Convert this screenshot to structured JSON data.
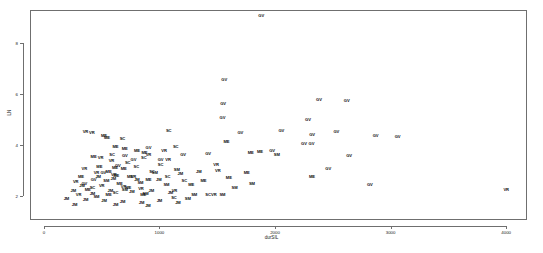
{
  "chart_data": {
    "type": "scatter",
    "title": "",
    "xlabel": "durSIL",
    "ylabel": "LN",
    "xlim": [
      -120,
      4180
    ],
    "ylim": [
      1.05,
      9.3
    ],
    "grid": false,
    "legend": null,
    "marker_style": "text-labels",
    "xticks": [
      0,
      1000,
      2000,
      3000,
      4000
    ],
    "xtick_labels": [
      "0",
      "1000",
      "2000",
      "3000",
      "4000"
    ],
    "yticks": [
      2,
      4,
      6,
      8
    ],
    "ytick_labels": [
      "2",
      "4",
      "6",
      "8"
    ],
    "point_groups": [
      "GV",
      "VR",
      "ME",
      "SC",
      "SM",
      "JM"
    ],
    "points": [
      {
        "label": "GV",
        "x": 1880,
        "y": 9.05
      },
      {
        "label": "GV",
        "x": 1560,
        "y": 6.55
      },
      {
        "label": "GV",
        "x": 1550,
        "y": 5.62
      },
      {
        "label": "GV",
        "x": 2380,
        "y": 5.75
      },
      {
        "label": "GV",
        "x": 2620,
        "y": 5.72
      },
      {
        "label": "GV",
        "x": 1545,
        "y": 5.05
      },
      {
        "label": "GV",
        "x": 2285,
        "y": 4.98
      },
      {
        "label": "GV",
        "x": 2530,
        "y": 4.5
      },
      {
        "label": "GV",
        "x": 2320,
        "y": 4.38
      },
      {
        "label": "GV",
        "x": 2870,
        "y": 4.35
      },
      {
        "label": "GV",
        "x": 3060,
        "y": 4.32
      },
      {
        "label": "GV",
        "x": 2250,
        "y": 4.05
      },
      {
        "label": "GV",
        "x": 2315,
        "y": 4.02
      },
      {
        "label": "GV",
        "x": 1700,
        "y": 4.48
      },
      {
        "label": "GV",
        "x": 2055,
        "y": 4.56
      },
      {
        "label": "GV",
        "x": 1975,
        "y": 3.78
      },
      {
        "label": "GV",
        "x": 2640,
        "y": 3.55
      },
      {
        "label": "GV",
        "x": 2460,
        "y": 3.05
      },
      {
        "label": "GV",
        "x": 2820,
        "y": 2.42
      },
      {
        "label": "GV",
        "x": 1205,
        "y": 3.62
      },
      {
        "label": "GV",
        "x": 1420,
        "y": 3.65
      },
      {
        "label": "GV",
        "x": 905,
        "y": 3.88
      },
      {
        "label": "GV",
        "x": 1010,
        "y": 3.42
      },
      {
        "label": "GV",
        "x": 700,
        "y": 3.55
      },
      {
        "label": "GV",
        "x": 775,
        "y": 3.4
      },
      {
        "label": "GV",
        "x": 640,
        "y": 3.18
      },
      {
        "label": "GV",
        "x": 515,
        "y": 2.88
      },
      {
        "label": "GV",
        "x": 430,
        "y": 2.62
      },
      {
        "label": "GV",
        "x": 350,
        "y": 2.45
      },
      {
        "label": "ME",
        "x": 1580,
        "y": 4.12
      },
      {
        "label": "ME",
        "x": 2320,
        "y": 2.72
      },
      {
        "label": "ME",
        "x": 1790,
        "y": 3.68
      },
      {
        "label": "ME",
        "x": 1870,
        "y": 3.72
      },
      {
        "label": "ME",
        "x": 1755,
        "y": 2.88
      },
      {
        "label": "ME",
        "x": 1600,
        "y": 2.7
      },
      {
        "label": "ME",
        "x": 1380,
        "y": 2.58
      },
      {
        "label": "ME",
        "x": 1275,
        "y": 2.42
      },
      {
        "label": "ME",
        "x": 520,
        "y": 4.35
      },
      {
        "label": "ME",
        "x": 545,
        "y": 4.28
      },
      {
        "label": "ME",
        "x": 620,
        "y": 3.92
      },
      {
        "label": "ME",
        "x": 700,
        "y": 3.82
      },
      {
        "label": "ME",
        "x": 805,
        "y": 3.78
      },
      {
        "label": "ME",
        "x": 870,
        "y": 3.7
      },
      {
        "label": "ME",
        "x": 430,
        "y": 3.52
      },
      {
        "label": "ME",
        "x": 480,
        "y": 3.12
      },
      {
        "label": "ME",
        "x": 615,
        "y": 3.08
      },
      {
        "label": "ME",
        "x": 690,
        "y": 3.05
      },
      {
        "label": "ME",
        "x": 560,
        "y": 2.92
      },
      {
        "label": "ME",
        "x": 625,
        "y": 2.78
      },
      {
        "label": "ME",
        "x": 745,
        "y": 2.72
      },
      {
        "label": "ME",
        "x": 320,
        "y": 2.72
      },
      {
        "label": "ME",
        "x": 905,
        "y": 2.62
      },
      {
        "label": "ME",
        "x": 655,
        "y": 2.48
      },
      {
        "label": "ME",
        "x": 730,
        "y": 2.3
      },
      {
        "label": "ME",
        "x": 380,
        "y": 2.22
      },
      {
        "label": "ME",
        "x": 560,
        "y": 2.05
      },
      {
        "label": "ME",
        "x": 860,
        "y": 2.02
      },
      {
        "label": "VR",
        "x": 4000,
        "y": 2.22
      },
      {
        "label": "VR",
        "x": 1490,
        "y": 3.22
      },
      {
        "label": "VR",
        "x": 1505,
        "y": 2.98
      },
      {
        "label": "VR",
        "x": 1075,
        "y": 3.4
      },
      {
        "label": "VR",
        "x": 360,
        "y": 4.52
      },
      {
        "label": "VR",
        "x": 415,
        "y": 4.48
      },
      {
        "label": "VR",
        "x": 1040,
        "y": 3.78
      },
      {
        "label": "VR",
        "x": 905,
        "y": 3.62
      },
      {
        "label": "VR",
        "x": 490,
        "y": 3.48
      },
      {
        "label": "VR",
        "x": 585,
        "y": 3.35
      },
      {
        "label": "VR",
        "x": 350,
        "y": 3.05
      },
      {
        "label": "VR",
        "x": 455,
        "y": 2.88
      },
      {
        "label": "VR",
        "x": 605,
        "y": 2.82
      },
      {
        "label": "VR",
        "x": 775,
        "y": 2.75
      },
      {
        "label": "VR",
        "x": 275,
        "y": 2.55
      },
      {
        "label": "VR",
        "x": 500,
        "y": 2.38
      },
      {
        "label": "VR",
        "x": 690,
        "y": 2.35
      },
      {
        "label": "VR",
        "x": 840,
        "y": 2.28
      },
      {
        "label": "VR",
        "x": 1130,
        "y": 2.18
      },
      {
        "label": "VR",
        "x": 300,
        "y": 2.02
      },
      {
        "label": "VR",
        "x": 1470,
        "y": 2.05
      },
      {
        "label": "SC",
        "x": 1080,
        "y": 4.55
      },
      {
        "label": "SC",
        "x": 680,
        "y": 4.25
      },
      {
        "label": "SC",
        "x": 1140,
        "y": 3.9
      },
      {
        "label": "SC",
        "x": 865,
        "y": 3.48
      },
      {
        "label": "SC",
        "x": 1010,
        "y": 3.22
      },
      {
        "label": "SC",
        "x": 590,
        "y": 3.62
      },
      {
        "label": "SC",
        "x": 725,
        "y": 3.3
      },
      {
        "label": "SC",
        "x": 800,
        "y": 3.15
      },
      {
        "label": "SC",
        "x": 935,
        "y": 2.95
      },
      {
        "label": "SC",
        "x": 1070,
        "y": 2.72
      },
      {
        "label": "SC",
        "x": 1215,
        "y": 2.58
      },
      {
        "label": "SC",
        "x": 420,
        "y": 2.32
      },
      {
        "label": "SC",
        "x": 620,
        "y": 2.12
      },
      {
        "label": "SC",
        "x": 1420,
        "y": 2.05
      },
      {
        "label": "SC",
        "x": 1125,
        "y": 1.92
      },
      {
        "label": "SM",
        "x": 2015,
        "y": 3.62
      },
      {
        "label": "SM",
        "x": 1800,
        "y": 2.48
      },
      {
        "label": "SM",
        "x": 1650,
        "y": 2.32
      },
      {
        "label": "SM",
        "x": 1545,
        "y": 2.05
      },
      {
        "label": "SM",
        "x": 1300,
        "y": 2.02
      },
      {
        "label": "SM",
        "x": 960,
        "y": 2.88
      },
      {
        "label": "SM",
        "x": 1150,
        "y": 3.02
      },
      {
        "label": "SM",
        "x": 835,
        "y": 2.52
      },
      {
        "label": "SM",
        "x": 1060,
        "y": 2.42
      },
      {
        "label": "SM",
        "x": 540,
        "y": 2.58
      },
      {
        "label": "SM",
        "x": 700,
        "y": 2.22
      },
      {
        "label": "SM",
        "x": 880,
        "y": 2.08
      },
      {
        "label": "SM",
        "x": 1245,
        "y": 1.88
      },
      {
        "label": "SM",
        "x": 455,
        "y": 1.95
      },
      {
        "label": "JM",
        "x": 1180,
        "y": 2.85
      },
      {
        "label": "JM",
        "x": 1340,
        "y": 2.92
      },
      {
        "label": "JM",
        "x": 995,
        "y": 2.62
      },
      {
        "label": "JM",
        "x": 805,
        "y": 2.62
      },
      {
        "label": "JM",
        "x": 600,
        "y": 2.65
      },
      {
        "label": "JM",
        "x": 470,
        "y": 2.72
      },
      {
        "label": "JM",
        "x": 330,
        "y": 2.38
      },
      {
        "label": "JM",
        "x": 255,
        "y": 2.18
      },
      {
        "label": "JM",
        "x": 420,
        "y": 2.08
      },
      {
        "label": "JM",
        "x": 575,
        "y": 2.18
      },
      {
        "label": "JM",
        "x": 760,
        "y": 2.15
      },
      {
        "label": "JM",
        "x": 930,
        "y": 2.2
      },
      {
        "label": "JM",
        "x": 1095,
        "y": 2.12
      },
      {
        "label": "JM",
        "x": 195,
        "y": 1.88
      },
      {
        "label": "JM",
        "x": 360,
        "y": 1.82
      },
      {
        "label": "JM",
        "x": 520,
        "y": 1.78
      },
      {
        "label": "JM",
        "x": 680,
        "y": 1.75
      },
      {
        "label": "JM",
        "x": 845,
        "y": 1.72
      },
      {
        "label": "JM",
        "x": 1000,
        "y": 1.8
      },
      {
        "label": "JM",
        "x": 1160,
        "y": 1.7
      },
      {
        "label": "JM",
        "x": 265,
        "y": 1.65
      },
      {
        "label": "JM",
        "x": 620,
        "y": 1.62
      },
      {
        "label": "JM",
        "x": 900,
        "y": 1.6
      }
    ]
  }
}
